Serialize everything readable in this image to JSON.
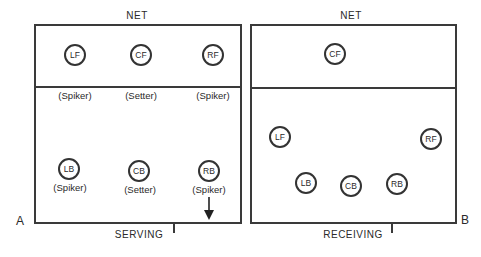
{
  "diagram": {
    "courts": [
      {
        "id": "A",
        "net_label": "NET",
        "baseline_label": "SERVING",
        "side_label": "A",
        "players": [
          {
            "pos": "LF",
            "role": "(Spiker)"
          },
          {
            "pos": "CF",
            "role": "(Setter)"
          },
          {
            "pos": "RF",
            "role": "(Spiker)"
          },
          {
            "pos": "LB",
            "role": "(Spiker)"
          },
          {
            "pos": "CB",
            "role": "(Setter)"
          },
          {
            "pos": "RB",
            "role": "(Spiker)"
          }
        ],
        "serve_arrow": "down-arrow-icon"
      },
      {
        "id": "B",
        "net_label": "NET",
        "baseline_label": "RECEIVING",
        "side_label": "B",
        "players": [
          {
            "pos": "CF"
          },
          {
            "pos": "LF"
          },
          {
            "pos": "RF"
          },
          {
            "pos": "LB"
          },
          {
            "pos": "CB"
          },
          {
            "pos": "RB"
          }
        ]
      }
    ]
  }
}
